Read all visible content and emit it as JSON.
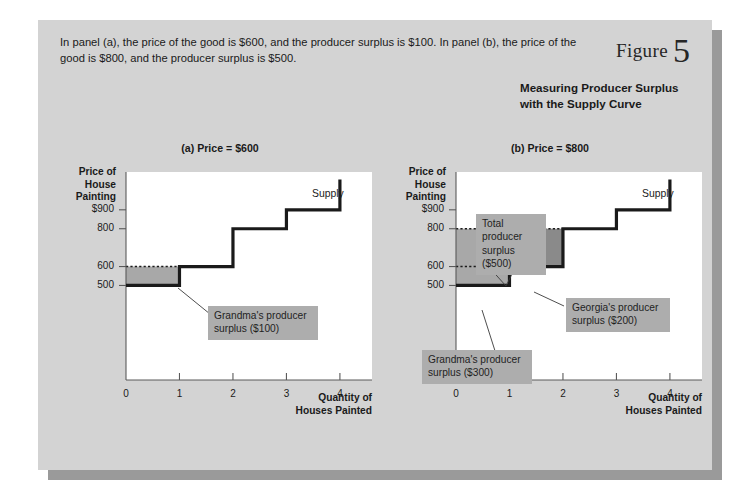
{
  "caption": "In panel (a), the price of the good is $600, and the producer surplus is $100. In panel (b), the price of the good is $800, and the producer surplus is $500.",
  "figure": {
    "word": "Figure",
    "number": "5",
    "title": "Measuring Producer Surplus with the Supply Curve"
  },
  "colors": {
    "card_background": "#d3d3d3",
    "card_shadow": "#9a9a9a",
    "plot_background": "#ffffff",
    "curve_stroke": "#1a1a1a",
    "surplus_light": "#a8a8a8",
    "surplus_dark": "#8a8a8a",
    "note_background": "#adadad",
    "text": "#1a1a1a"
  },
  "panels": [
    {
      "id": "a",
      "title": "(a) Price = $600",
      "curve_label": "Supply",
      "axis": {
        "ylabel": "Price of House Painting",
        "ylabel_lines": [
          "Price of",
          "House",
          "Painting"
        ],
        "xlabel": "Quantity of Houses Painted",
        "xlabel_lines": [
          "Quantity of",
          "Houses Painted"
        ],
        "yticks": [
          "$900",
          "800",
          "600",
          "500"
        ],
        "ytick_values": [
          900,
          800,
          600,
          500
        ],
        "xticks": [
          "0",
          "1",
          "2",
          "3",
          "4"
        ],
        "xtick_values": [
          0,
          1,
          2,
          3,
          4
        ]
      },
      "notes": [
        {
          "text": "Grandma's producer surplus ($100)",
          "lines": [
            "Grandma's producer",
            "surplus ($100)"
          ]
        }
      ]
    },
    {
      "id": "b",
      "title": "(b) Price = $800",
      "curve_label": "Supply",
      "axis": {
        "ylabel": "Price of House Painting",
        "ylabel_lines": [
          "Price of",
          "House",
          "Painting"
        ],
        "xlabel": "Quantity of Houses Painted",
        "xlabel_lines": [
          "Quantity of",
          "Houses Painted"
        ],
        "yticks": [
          "$900",
          "800",
          "600",
          "500"
        ],
        "ytick_values": [
          900,
          800,
          600,
          500
        ],
        "xticks": [
          "0",
          "1",
          "2",
          "3",
          "4"
        ],
        "xtick_values": [
          0,
          1,
          2,
          3,
          4
        ]
      },
      "notes": [
        {
          "text": "Total producer surplus ($500)",
          "lines": [
            "Total",
            "producer",
            "surplus ($500)"
          ]
        },
        {
          "text": "Georgia's producer surplus ($200)",
          "lines": [
            "Georgia's producer",
            "surplus ($200)"
          ]
        },
        {
          "text": "Grandma's producer surplus ($300)",
          "lines": [
            "Grandma's producer",
            "surplus ($300)"
          ]
        }
      ]
    }
  ],
  "chart_data": [
    {
      "type": "line",
      "chart_id": "panel-a",
      "title": "(a) Price = $600",
      "xlabel": "Quantity of Houses Painted",
      "ylabel": "Price of House Painting",
      "xlim": [
        0,
        4.6
      ],
      "ylim": [
        0,
        1100
      ],
      "grid": false,
      "legend": "inline",
      "series": [
        {
          "name": "Supply",
          "style": "step",
          "points": [
            {
              "q": 0,
              "price": 500
            },
            {
              "q": 1,
              "price": 500
            },
            {
              "q": 1,
              "price": 600
            },
            {
              "q": 2,
              "price": 600
            },
            {
              "q": 2,
              "price": 800
            },
            {
              "q": 3,
              "price": 800
            },
            {
              "q": 3,
              "price": 900
            },
            {
              "q": 4,
              "price": 900
            },
            {
              "q": 4,
              "price": 1060
            }
          ]
        }
      ],
      "market_price": 600,
      "shaded_regions": [
        {
          "name": "Grandma's producer surplus",
          "value": 100,
          "label": "Grandma's producer surplus ($100)",
          "q_range": [
            0,
            1
          ],
          "price_range": [
            500,
            600
          ],
          "shade": "light"
        }
      ],
      "price_line": {
        "value": 600,
        "style": "dotted",
        "q_range": [
          0,
          1
        ]
      }
    },
    {
      "type": "line",
      "chart_id": "panel-b",
      "title": "(b) Price = $800",
      "xlabel": "Quantity of Houses Painted",
      "ylabel": "Price of House Painting",
      "xlim": [
        0,
        4.6
      ],
      "ylim": [
        0,
        1100
      ],
      "grid": false,
      "legend": "inline",
      "series": [
        {
          "name": "Supply",
          "style": "step",
          "points": [
            {
              "q": 0,
              "price": 500
            },
            {
              "q": 1,
              "price": 500
            },
            {
              "q": 1,
              "price": 600
            },
            {
              "q": 2,
              "price": 600
            },
            {
              "q": 2,
              "price": 800
            },
            {
              "q": 3,
              "price": 800
            },
            {
              "q": 3,
              "price": 900
            },
            {
              "q": 4,
              "price": 900
            },
            {
              "q": 4,
              "price": 1060
            }
          ]
        }
      ],
      "market_price": 800,
      "shaded_regions": [
        {
          "name": "Grandma's producer surplus",
          "value": 300,
          "label": "Grandma's producer surplus ($300)",
          "q_range": [
            0,
            1
          ],
          "price_range": [
            500,
            800
          ],
          "shade": "light"
        },
        {
          "name": "Georgia's producer surplus",
          "value": 200,
          "label": "Georgia's producer surplus ($200)",
          "q_range": [
            1,
            2
          ],
          "price_range": [
            600,
            800
          ],
          "shade": "dark"
        },
        {
          "name": "Total producer surplus",
          "value": 500,
          "label": "Total producer surplus ($500)",
          "q_range": [
            0,
            2
          ],
          "price_range": [
            500,
            800
          ],
          "shade": "combined"
        }
      ],
      "price_line": {
        "value": 800,
        "style": "dotted",
        "q_range": [
          0,
          2
        ]
      },
      "reference_lines": [
        {
          "value": 600,
          "style": "dotted",
          "q_range": [
            0,
            1
          ]
        },
        {
          "q": 1,
          "style": "dotted",
          "price_range": [
            600,
            800
          ]
        }
      ]
    }
  ]
}
